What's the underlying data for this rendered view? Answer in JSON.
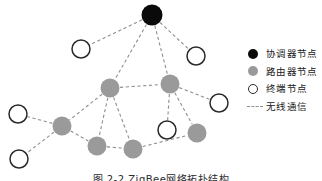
{
  "figure": {
    "caption": "图 2-2  ZigBee网络拓扑结构"
  },
  "legend": {
    "items": [
      {
        "symbol": "filled-black-circle",
        "label": "协调器节点",
        "color": "#0a0a0a"
      },
      {
        "symbol": "filled-gray-circle",
        "label": "路由器节点",
        "color": "#9a9a9a"
      },
      {
        "symbol": "hollow-circle",
        "label": "终端节点",
        "color": "#ffffff"
      },
      {
        "symbol": "dashed-line",
        "label": "无线通信",
        "color": "#8f8f8f"
      }
    ]
  },
  "diagram": {
    "type": "network-topology",
    "edge_color": "#8f8f8f",
    "nodes": [
      {
        "id": "C1",
        "role": "coordinator",
        "x": 152,
        "y": 15,
        "r": 10.5
      },
      {
        "id": "R1",
        "role": "router",
        "x": 110,
        "y": 88,
        "r": 9.5
      },
      {
        "id": "R2",
        "role": "router",
        "x": 170,
        "y": 84,
        "r": 9.5
      },
      {
        "id": "R3",
        "role": "router",
        "x": 62,
        "y": 126,
        "r": 9.5
      },
      {
        "id": "R4",
        "role": "router",
        "x": 97,
        "y": 146,
        "r": 9.5
      },
      {
        "id": "R5",
        "role": "router",
        "x": 133,
        "y": 149,
        "r": 9.5
      },
      {
        "id": "R6",
        "role": "router",
        "x": 197,
        "y": 133,
        "r": 9.5
      },
      {
        "id": "E1",
        "role": "end",
        "x": 81,
        "y": 49,
        "r": 9.0
      },
      {
        "id": "E2",
        "role": "end",
        "x": 196,
        "y": 56,
        "r": 9.0
      },
      {
        "id": "E3",
        "role": "end",
        "x": 219,
        "y": 103,
        "r": 9.0
      },
      {
        "id": "E4",
        "role": "end",
        "x": 18,
        "y": 114,
        "r": 9.0
      },
      {
        "id": "E5",
        "role": "end",
        "x": 19,
        "y": 159,
        "r": 9.0
      },
      {
        "id": "E6",
        "role": "end",
        "x": 167,
        "y": 130,
        "r": 9.0
      }
    ],
    "edges": [
      {
        "from": "C1",
        "to": "E1"
      },
      {
        "from": "C1",
        "to": "E2"
      },
      {
        "from": "C1",
        "to": "R1"
      },
      {
        "from": "C1",
        "to": "R2"
      },
      {
        "from": "R1",
        "to": "R2"
      },
      {
        "from": "R1",
        "to": "R3"
      },
      {
        "from": "R1",
        "to": "R4"
      },
      {
        "from": "R1",
        "to": "R5"
      },
      {
        "from": "R2",
        "to": "E3"
      },
      {
        "from": "R2",
        "to": "E6"
      },
      {
        "from": "R2",
        "to": "R6"
      },
      {
        "from": "R3",
        "to": "E4"
      },
      {
        "from": "R3",
        "to": "E5"
      },
      {
        "from": "R3",
        "to": "R4"
      },
      {
        "from": "R4",
        "to": "R5"
      },
      {
        "from": "R5",
        "to": "R6"
      }
    ]
  }
}
